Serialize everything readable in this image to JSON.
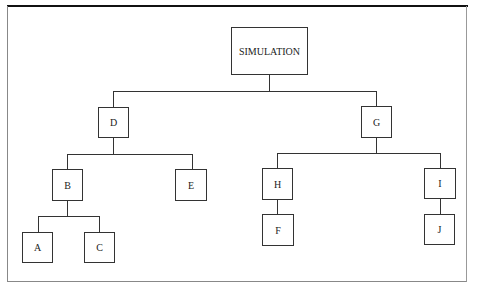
{
  "diagram": {
    "type": "tree",
    "root": {
      "label": "SIMULATION",
      "children": [
        {
          "label": "D",
          "children": [
            {
              "label": "B",
              "children": [
                {
                  "label": "A"
                },
                {
                  "label": "C"
                }
              ]
            },
            {
              "label": "E"
            }
          ]
        },
        {
          "label": "G",
          "children": [
            {
              "label": "H",
              "children": [
                {
                  "label": "F"
                }
              ]
            },
            {
              "label": "I",
              "children": [
                {
                  "label": "J"
                }
              ]
            }
          ]
        }
      ]
    },
    "nodes": {
      "simulation": "SIMULATION",
      "d": "D",
      "g": "G",
      "b": "B",
      "e": "E",
      "h": "H",
      "i": "I",
      "a": "A",
      "c": "C",
      "f": "F",
      "j": "J"
    }
  }
}
